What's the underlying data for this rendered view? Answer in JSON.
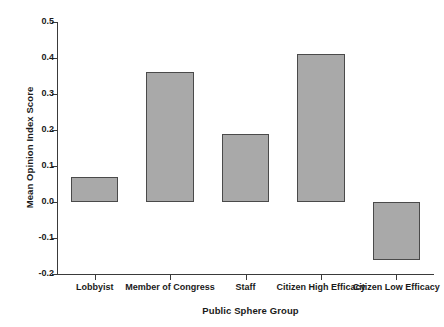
{
  "chart_data": {
    "type": "bar",
    "title": "",
    "xlabel": "Public Sphere Group",
    "ylabel": "Mean Opinion Index Score",
    "categories": [
      "Lobbyist",
      "Member of Congress",
      "Staff",
      "Citizen High Efficacy",
      "Citizen Low Efficacy"
    ],
    "values": [
      0.07,
      0.36,
      0.19,
      0.41,
      -0.16
    ],
    "ylim": [
      -0.2,
      0.5
    ],
    "yticks": [
      0.5,
      0.4,
      0.3,
      0.2,
      0.1,
      0.0,
      -0.1,
      -0.2
    ],
    "ytick_labels": [
      "0.5",
      "0.4",
      "0.3",
      "0.2",
      "0.1",
      "0.0",
      "-0.1",
      "-0.2"
    ],
    "grid": false,
    "legend": null,
    "bar_color": "#a9a9a9",
    "bar_edge_color": "#4a4a4a",
    "axis_color": "#3a3a3a",
    "background": "#ffffff"
  }
}
